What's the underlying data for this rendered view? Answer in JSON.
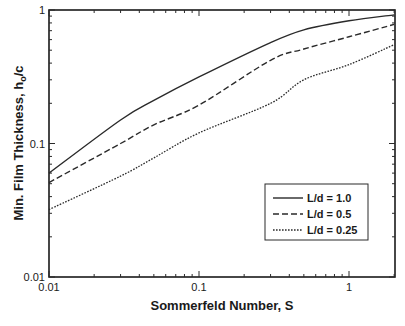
{
  "chart_data": {
    "type": "line",
    "title": "",
    "xlabel": "Sommerfeld Number, S",
    "ylabel_main": "Min. Film Thickness, h",
    "ylabel_sub": "o",
    "ylabel_tail": "/c",
    "ylabel": "Min. Film Thickness, h_o/c",
    "xscale": "log",
    "yscale": "log",
    "xlim": [
      0.01,
      2.0
    ],
    "ylim": [
      0.01,
      1.0
    ],
    "x_ticks": [
      {
        "value": 0.01,
        "label": "0.01"
      },
      {
        "value": 0.1,
        "label": "0.1"
      },
      {
        "value": 1,
        "label": "1"
      }
    ],
    "y_ticks": [
      {
        "value": 0.01,
        "label": "0.01"
      },
      {
        "value": 0.1,
        "label": "0.1"
      },
      {
        "value": 1,
        "label": "1"
      }
    ],
    "grid": false,
    "legend_position": "lower right (inside)",
    "x": [
      0.01,
      0.03,
      0.05,
      0.1,
      0.3,
      0.5,
      1.0,
      2.0
    ],
    "series": [
      {
        "name": "L/d = 1.0",
        "style": "solid",
        "values": [
          0.06,
          0.15,
          0.21,
          0.315,
          0.57,
          0.71,
          0.83,
          0.92
        ]
      },
      {
        "name": "L/d = 0.5",
        "style": "dashed",
        "values": [
          0.051,
          0.1,
          0.138,
          0.194,
          0.42,
          0.51,
          0.63,
          0.78
        ]
      },
      {
        "name": "L/d = 0.25",
        "style": "dotted",
        "values": [
          0.032,
          0.057,
          0.078,
          0.12,
          0.2,
          0.3,
          0.39,
          0.55
        ]
      }
    ]
  },
  "colors": {
    "line": "#2a2a2a",
    "axis": "#1a1a1a",
    "background": "#ffffff"
  }
}
